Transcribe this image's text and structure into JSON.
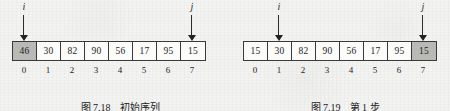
{
  "figures": [
    {
      "id": "fig-7-18",
      "caption_label": "图 7.18",
      "caption_text": "初始序列",
      "indices": [
        "0",
        "1",
        "2",
        "3",
        "4",
        "5",
        "6",
        "7"
      ],
      "cells": [
        {
          "value": "46",
          "shaded": true
        },
        {
          "value": "30",
          "shaded": false
        },
        {
          "value": "82",
          "shaded": false
        },
        {
          "value": "90",
          "shaded": false
        },
        {
          "value": "56",
          "shaded": false
        },
        {
          "value": "17",
          "shaded": false
        },
        {
          "value": "95",
          "shaded": false
        },
        {
          "value": "15",
          "shaded": false
        }
      ],
      "pointers": [
        {
          "label": "i",
          "index": 0
        },
        {
          "label": "j",
          "index": 7
        }
      ]
    },
    {
      "id": "fig-7-19",
      "caption_label": "图 7.19",
      "caption_text": "第 1 步",
      "indices": [
        "0",
        "1",
        "2",
        "3",
        "4",
        "5",
        "6",
        "7"
      ],
      "cells": [
        {
          "value": "15",
          "shaded": false
        },
        {
          "value": "30",
          "shaded": false
        },
        {
          "value": "82",
          "shaded": false
        },
        {
          "value": "90",
          "shaded": false
        },
        {
          "value": "56",
          "shaded": false
        },
        {
          "value": "17",
          "shaded": false
        },
        {
          "value": "95",
          "shaded": false
        },
        {
          "value": "15",
          "shaded": true
        }
      ],
      "pointers": [
        {
          "label": "i",
          "index": 1
        },
        {
          "label": "j",
          "index": 7
        }
      ]
    }
  ],
  "colors": {
    "page_background": "#f3f3f2",
    "cell_border": "#3a3a3a",
    "cell_shaded_fill": "#b9b9b6",
    "ink": "#1d1d1d"
  }
}
